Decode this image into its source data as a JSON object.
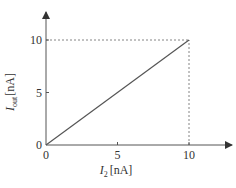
{
  "chart_data": {
    "type": "line",
    "title": "",
    "xlabel": "I2 [nA]",
    "ylabel": "Iout [nA]",
    "xlabel_parts": {
      "symbol": "I",
      "subscript": "2",
      "unit": "[nA]"
    },
    "ylabel_parts": {
      "symbol": "I",
      "subscript": "out",
      "unit": "[nA]"
    },
    "xlim": [
      0,
      12
    ],
    "ylim": [
      0,
      12.5
    ],
    "x_ticks": [
      0,
      5,
      10
    ],
    "y_ticks": [
      0,
      5,
      10
    ],
    "x_tick_labels": [
      "0",
      "5",
      "10"
    ],
    "y_tick_labels": [
      "0",
      "5",
      "10"
    ],
    "grid": false,
    "legend": null,
    "series": [
      {
        "name": "Iout vs I2",
        "x": [
          0,
          10
        ],
        "y": [
          0,
          10
        ],
        "style": "solid"
      }
    ],
    "annotations": [
      {
        "type": "dashed-guide",
        "from": [
          0,
          10
        ],
        "to": [
          10,
          10
        ]
      },
      {
        "type": "dashed-guide",
        "from": [
          10,
          0
        ],
        "to": [
          10,
          10
        ]
      }
    ],
    "colors": {
      "line": "#555555",
      "axis": "#555555",
      "text": "#333333"
    }
  }
}
